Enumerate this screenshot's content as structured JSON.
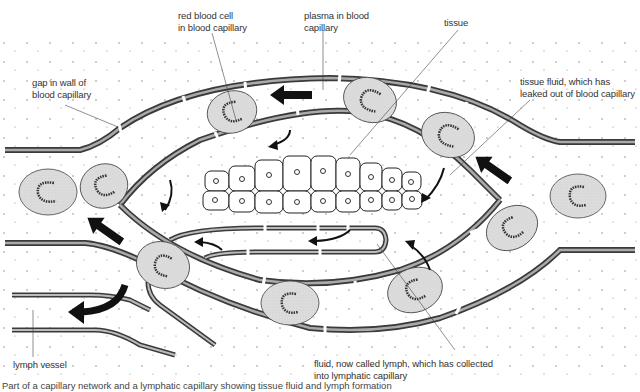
{
  "diagram": {
    "type": "biology-illustration",
    "colors": {
      "wall_outer": "#3a3a3a",
      "wall_inner": "#a8a8a8",
      "red_cell_fill": "#dcdcdc",
      "arrow": "#111111",
      "label_text": "#333333",
      "leader_line": "#444444"
    }
  },
  "labels": {
    "red_blood_cell": [
      "red blood cell",
      "in blood capillary"
    ],
    "plasma": [
      "plasma in blood",
      "capillary"
    ],
    "tissue": [
      "tissue"
    ],
    "gap_in_wall": [
      "gap in wall of",
      "blood capillary"
    ],
    "tissue_fluid": [
      "tissue fluid, which has",
      "leaked out of blood capillary"
    ],
    "lymph_vessel": [
      "lymph vessel"
    ],
    "lymph_fluid": [
      "fluid, now called lymph, which has collected",
      "into lymphatic capillary"
    ]
  },
  "caption": "Part of a capillary network and a lymphatic capillary showing tissue fluid and lymph formation"
}
